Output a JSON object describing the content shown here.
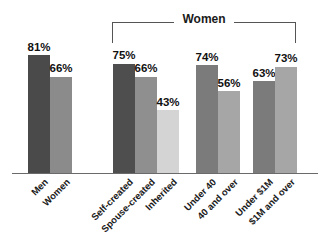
{
  "chart_data": {
    "type": "bar",
    "title": "",
    "xlabel": "",
    "ylabel": "",
    "ylim": [
      0,
      100
    ],
    "grid": false,
    "legend": "none",
    "value_suffix": "%",
    "group_bracket": {
      "label": "Women",
      "covers_groups": [
        "Self-created / Spouse-created / Inherited",
        "Under 40 / 40 and over",
        "Under $1M / $1M and over"
      ]
    },
    "categories": [
      "Men",
      "Women",
      "Self-created",
      "Spouse-created",
      "Inherited",
      "Under 40",
      "40 and over",
      "Under $1M",
      "$1M and over"
    ],
    "values": [
      81,
      66,
      75,
      66,
      43,
      74,
      56,
      63,
      73
    ],
    "groups": [
      {
        "name": "gender",
        "bars": [
          {
            "label": "Men",
            "value": 81,
            "value_label": "81%",
            "color": "#4a4a4a",
            "x": 28,
            "width": 22
          },
          {
            "label": "Women",
            "value": 66,
            "value_label": "66%",
            "color": "#8b8b8b",
            "x": 50,
            "width": 22
          }
        ]
      },
      {
        "name": "wealth-origin",
        "bars": [
          {
            "label": "Self-created",
            "value": 75,
            "value_label": "75%",
            "color": "#4e4e4e",
            "x": 113,
            "width": 22
          },
          {
            "label": "Spouse-created",
            "value": 66,
            "value_label": "66%",
            "color": "#8f8f8f",
            "x": 135,
            "width": 22
          },
          {
            "label": "Inherited",
            "value": 43,
            "value_label": "43%",
            "color": "#d4d4d4",
            "x": 157,
            "width": 22
          }
        ]
      },
      {
        "name": "age",
        "bars": [
          {
            "label": "Under 40",
            "value": 74,
            "value_label": "74%",
            "color": "#7b7b7b",
            "x": 196,
            "width": 22
          },
          {
            "label": "40 and over",
            "value": 56,
            "value_label": "56%",
            "color": "#a6a6a6",
            "x": 218,
            "width": 22
          }
        ]
      },
      {
        "name": "wealth-level",
        "bars": [
          {
            "label": "Under $1M",
            "value": 63,
            "value_label": "63%",
            "color": "#7b7b7b",
            "x": 253,
            "width": 22
          },
          {
            "label": "$1M and over",
            "value": 73,
            "value_label": "73%",
            "color": "#a6a6a6",
            "x": 275,
            "width": 22
          }
        ]
      }
    ]
  }
}
